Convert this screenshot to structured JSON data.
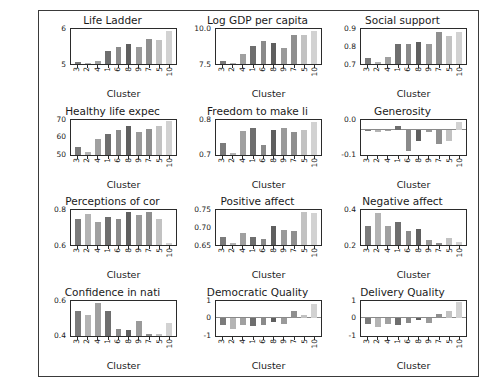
{
  "figure": {
    "xlabel": "Cluster",
    "categories": [
      "3",
      "2",
      "4",
      "1",
      "6",
      "8",
      "9",
      "7",
      "5",
      "10"
    ],
    "cluster_colors": [
      "#7b7b7b",
      "#b4b4b4",
      "#a0a0a0",
      "#6e6e6e",
      "#8a8a8a",
      "#5f5f5f",
      "#9a9a9a",
      "#8f8f8f",
      "#c2c2c2",
      "#d2d2d2"
    ]
  },
  "chart_data": [
    {
      "type": "bar",
      "title": "Life Ladder",
      "xlabel": "Cluster",
      "ylabel": "",
      "categories": [
        "3",
        "2",
        "4",
        "1",
        "6",
        "8",
        "9",
        "7",
        "5",
        "10"
      ],
      "values": [
        4.55,
        4.45,
        4.62,
        5.25,
        5.55,
        5.7,
        5.5,
        6.05,
        5.95,
        6.55
      ],
      "yticks": [
        "6",
        "5"
      ],
      "ylim": [
        4.4,
        6.7
      ],
      "grid": false,
      "legend": "none"
    },
    {
      "type": "bar",
      "title": "Log GDP per capita",
      "xlabel": "Cluster",
      "ylabel": "",
      "categories": [
        "3",
        "2",
        "4",
        "1",
        "6",
        "8",
        "9",
        "7",
        "5",
        "10"
      ],
      "values": [
        7.55,
        7.4,
        8.15,
        8.85,
        9.3,
        9.1,
        8.65,
        9.75,
        9.8,
        10.1
      ],
      "yticks": [
        "10.0",
        "7.5"
      ],
      "ylim": [
        7.3,
        10.3
      ],
      "grid": false,
      "legend": "none"
    },
    {
      "type": "bar",
      "title": "Social support",
      "xlabel": "Cluster",
      "ylabel": "",
      "categories": [
        "3",
        "2",
        "4",
        "1",
        "6",
        "8",
        "9",
        "7",
        "5",
        "10"
      ],
      "values": [
        0.705,
        0.675,
        0.715,
        0.805,
        0.81,
        0.82,
        0.805,
        0.895,
        0.865,
        0.9
      ],
      "yticks": [
        "0.9",
        "0.8",
        "0.7"
      ],
      "ylim": [
        0.66,
        0.92
      ],
      "grid": false,
      "legend": "none"
    },
    {
      "type": "bar",
      "title": "Healthy life expec",
      "xlabel": "Cluster",
      "ylabel": "",
      "categories": [
        "3",
        "2",
        "4",
        "1",
        "6",
        "8",
        "9",
        "7",
        "5",
        "10"
      ],
      "values": [
        52.5,
        48.5,
        58.5,
        62.5,
        65.5,
        68.5,
        63.5,
        66.0,
        68.0,
        72.0
      ],
      "yticks": [
        "70",
        "60",
        "50"
      ],
      "ylim": [
        47,
        73
      ],
      "grid": false,
      "legend": "none"
    },
    {
      "type": "bar",
      "title": "Freedom to make li",
      "xlabel": "Cluster",
      "ylabel": "",
      "categories": [
        "3",
        "2",
        "4",
        "1",
        "6",
        "8",
        "9",
        "7",
        "5",
        "10"
      ],
      "values": [
        0.715,
        0.665,
        0.78,
        0.8,
        0.705,
        0.79,
        0.8,
        0.775,
        0.79,
        0.83
      ],
      "yticks": [
        "0.8",
        "0.7"
      ],
      "ylim": [
        0.655,
        0.845
      ],
      "grid": false,
      "legend": "none"
    },
    {
      "type": "bar",
      "title": "Generosity",
      "xlabel": "Cluster",
      "ylabel": "",
      "categories": [
        "3",
        "2",
        "4",
        "1",
        "6",
        "8",
        "9",
        "7",
        "5",
        "10"
      ],
      "values": [
        -0.005,
        -0.012,
        -0.008,
        0.018,
        -0.105,
        -0.055,
        -0.012,
        -0.07,
        -0.055,
        0.04
      ],
      "yticks": [
        "0.0",
        "-0.1"
      ],
      "ylim": [
        -0.12,
        0.05
      ],
      "grid": false,
      "legend": "none"
    },
    {
      "type": "bar",
      "title": "Perceptions of cor",
      "xlabel": "Cluster",
      "ylabel": "",
      "categories": [
        "3",
        "2",
        "4",
        "1",
        "6",
        "8",
        "9",
        "7",
        "5",
        "10"
      ],
      "values": [
        0.755,
        0.8,
        0.73,
        0.775,
        0.76,
        0.82,
        0.79,
        0.82,
        0.76,
        0.54
      ],
      "yticks": [
        "0.8",
        "0.6"
      ],
      "ylim": [
        0.52,
        0.84
      ],
      "grid": false,
      "legend": "none"
    },
    {
      "type": "bar",
      "title": "Positive affect",
      "xlabel": "Cluster",
      "ylabel": "",
      "categories": [
        "3",
        "2",
        "4",
        "1",
        "6",
        "8",
        "9",
        "7",
        "5",
        "10"
      ],
      "values": [
        0.665,
        0.645,
        0.682,
        0.668,
        0.66,
        0.705,
        0.692,
        0.688,
        0.755,
        0.752
      ],
      "yticks": [
        "0.75",
        "0.70",
        "0.65"
      ],
      "ylim": [
        0.638,
        0.762
      ],
      "grid": false,
      "legend": "none"
    },
    {
      "type": "bar",
      "title": "Negative affect",
      "xlabel": "Cluster",
      "ylabel": "",
      "categories": [
        "3",
        "2",
        "4",
        "1",
        "6",
        "8",
        "9",
        "7",
        "5",
        "10"
      ],
      "values": [
        0.315,
        0.4,
        0.32,
        0.34,
        0.285,
        0.295,
        0.225,
        0.21,
        0.24,
        0.215
      ],
      "yticks": [
        "0.4",
        "0.2"
      ],
      "ylim": [
        0.195,
        0.42
      ],
      "grid": false,
      "legend": "none"
    },
    {
      "type": "bar",
      "title": "Confidence in nati",
      "xlabel": "Cluster",
      "ylabel": "",
      "categories": [
        "3",
        "2",
        "4",
        "1",
        "6",
        "8",
        "9",
        "7",
        "5",
        "10"
      ],
      "values": [
        0.58,
        0.55,
        0.66,
        0.58,
        0.42,
        0.41,
        0.49,
        0.37,
        0.37,
        0.47
      ],
      "yticks": [
        "0.6",
        "0.4"
      ],
      "ylim": [
        0.355,
        0.68
      ],
      "grid": false,
      "legend": "none"
    },
    {
      "type": "bar",
      "title": "Democratic Quality",
      "xlabel": "Cluster",
      "ylabel": "",
      "categories": [
        "3",
        "2",
        "4",
        "1",
        "6",
        "8",
        "9",
        "7",
        "5",
        "10"
      ],
      "values": [
        -0.42,
        -0.72,
        -0.45,
        -0.5,
        -0.42,
        -0.25,
        -0.38,
        0.45,
        0.22,
        0.85
      ],
      "yticks": [
        "1",
        "0",
        "-1"
      ],
      "ylim": [
        -1.1,
        1.1
      ],
      "grid": false,
      "legend": "none"
    },
    {
      "type": "bar",
      "title": "Delivery Quality",
      "xlabel": "Cluster",
      "ylabel": "",
      "categories": [
        "3",
        "2",
        "4",
        "1",
        "6",
        "8",
        "9",
        "7",
        "5",
        "10"
      ],
      "values": [
        -0.38,
        -0.58,
        -0.35,
        -0.45,
        -0.3,
        -0.12,
        -0.3,
        0.28,
        0.42,
        1.0
      ],
      "yticks": [
        "1",
        "0",
        "-1"
      ],
      "ylim": [
        -1.1,
        1.1
      ],
      "grid": false,
      "legend": "none"
    }
  ]
}
